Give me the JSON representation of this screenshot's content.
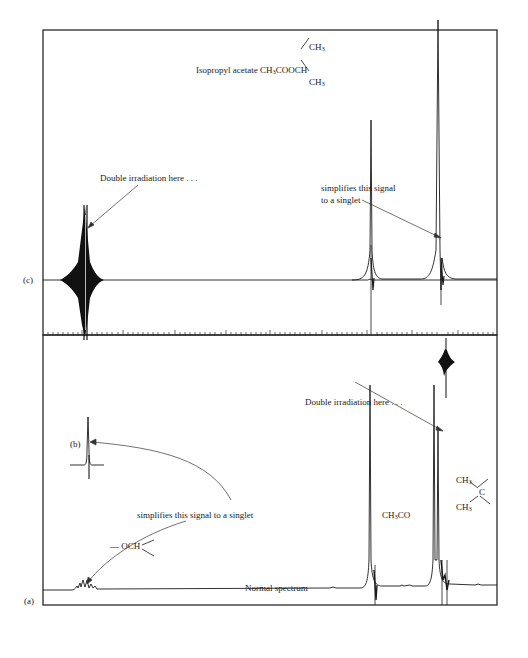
{
  "figure": {
    "compound": {
      "name": "Isopropyl acetate",
      "formula_prefix": "CH",
      "formula_sub1": "3",
      "formula_mid": "COOCH",
      "branch_top": "CH",
      "branch_top_sub": "3",
      "branch_bottom": "CH",
      "branch_bottom_sub": "3"
    },
    "panel_c": {
      "label": "(c)",
      "annotation_left": "Double irradiation here . . .",
      "annotation_right_line1": "simplifies this signal",
      "annotation_right_line2": "to a singlet"
    },
    "panel_b": {
      "label": "(b)"
    },
    "panel_a": {
      "label": "(a)",
      "annotation_irradiation": "Double irradiation here . . .",
      "annotation_simplifies": "simplifies this signal to a singlet",
      "caption": "Normal spectrum",
      "group_och": "— OCH",
      "group_ch3co_prefix": "CH",
      "group_ch3co_sub": "3",
      "group_ch3co_suffix": "CO",
      "group_c_top": "CH",
      "group_c_top_sub": "3",
      "group_c_center": "C",
      "group_c_bottom": "CH",
      "group_c_bottom_sub": "3"
    }
  },
  "colors": {
    "ink": "#1a1a1a",
    "frame": "#2a2a2a",
    "background": "#ffffff"
  }
}
